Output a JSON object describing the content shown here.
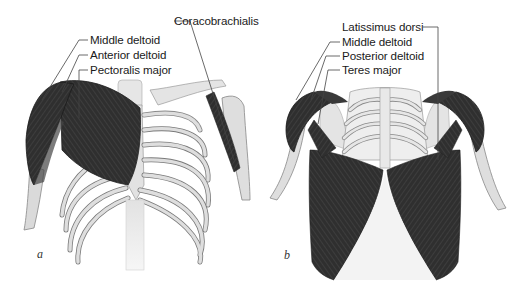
{
  "figure": {
    "panels": [
      {
        "id": "a",
        "letter": "a",
        "view": "anterior",
        "labels": [
          {
            "text": "Coracobrachialis"
          },
          {
            "text": "Middle deltoid"
          },
          {
            "text": "Anterior deltoid"
          },
          {
            "text": "Pectoralis major"
          }
        ]
      },
      {
        "id": "b",
        "letter": "b",
        "view": "posterior",
        "labels": [
          {
            "text": "Latissimus dorsi"
          },
          {
            "text": "Middle deltoid"
          },
          {
            "text": "Posterior deltoid"
          },
          {
            "text": "Teres major"
          }
        ]
      }
    ],
    "colors": {
      "muscle": "#2e2e2e",
      "muscle_light": "#4a4a4a",
      "bone": "#dcdcdc",
      "bone_outline": "#7a7a7a",
      "leader_line": "#444444",
      "background": "#ffffff"
    }
  }
}
